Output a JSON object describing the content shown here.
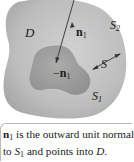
{
  "figure": {
    "region_label": "D",
    "outer_surface_label": "S",
    "outer_surface_sub": "2",
    "inner_surface_label": "S",
    "inner_surface_sub": "1",
    "full_surface_label": "S",
    "normal_outward_label": "n",
    "normal_outward_sub": "1",
    "normal_inward_prefix": "−",
    "normal_inward_label": "n",
    "normal_inward_sub": "1",
    "colors": {
      "outer_region": "#b8b8b8",
      "inner_region": "#9e9e9e",
      "arrow": "#333333"
    }
  },
  "caption": {
    "line1_bold": "n",
    "line1_sub": "1",
    "line1_rest": " is the outward unit normal",
    "line2_pre": "to ",
    "line2_var": "S",
    "line2_sub": "1",
    "line2_rest": " and points into ",
    "line2_end_var": "D",
    "line2_end": ".",
    "line3_partial": "The outward unit normal to S"
  }
}
